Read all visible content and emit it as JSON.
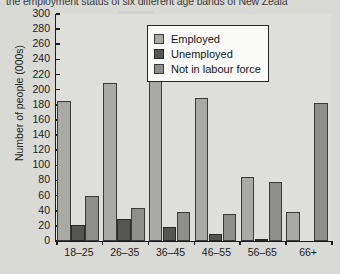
{
  "caption": "the employment status of six different age bands of New Zeala",
  "chart_data": {
    "type": "bar",
    "title": "",
    "xlabel": "",
    "ylabel": "Number of people (000s)",
    "categories": [
      "18–25",
      "26–35",
      "36–45",
      "46–55",
      "56–65",
      "66+"
    ],
    "series": [
      {
        "name": "Employed",
        "color": "#a9a9a6",
        "values": [
          185,
          209,
          255,
          189,
          84,
          39
        ]
      },
      {
        "name": "Unemployed",
        "color": "#555554",
        "values": [
          21,
          29,
          19,
          9,
          3,
          0
        ]
      },
      {
        "name": "Not in labour force",
        "color": "#8e8e8b",
        "values": [
          59,
          44,
          39,
          36,
          78,
          183
        ]
      }
    ],
    "ylim": [
      0,
      300
    ],
    "ytick_step": 20,
    "yticks": [
      0,
      20,
      40,
      60,
      80,
      100,
      120,
      140,
      160,
      180,
      200,
      220,
      240,
      260,
      280,
      300
    ],
    "grid": false,
    "legend_position": "top-right"
  }
}
